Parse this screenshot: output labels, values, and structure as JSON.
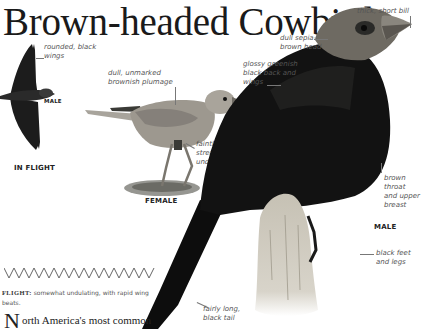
{
  "page": {
    "title": "Brown-headed Cowbird"
  },
  "figures": {
    "in_flight": {
      "sex_label": "MALE",
      "caption": "IN FLIGHT",
      "annotations": [
        {
          "id": "wings",
          "line1": "rounded, black",
          "line2": "wings"
        }
      ]
    },
    "female": {
      "caption": "FEMALE",
      "annotations": [
        {
          "id": "plumage",
          "line1": "dull, unmarked",
          "line2": "brownish plumage"
        },
        {
          "id": "underparts",
          "line1": "faintly",
          "line2": "streaked",
          "line3": "underparts"
        }
      ]
    },
    "male": {
      "caption": "MALE",
      "annotations": [
        {
          "id": "bill",
          "line1": "thick, short bill"
        },
        {
          "id": "head",
          "line1": "dull sepia-",
          "line2": "brown head"
        },
        {
          "id": "back",
          "line1": "glossy greenish",
          "line2": "black back and",
          "line3": "wings"
        },
        {
          "id": "throat",
          "line1": "brown",
          "line2": "throat",
          "line3": "and upper",
          "line4": "breast"
        },
        {
          "id": "feet",
          "line1": "black feet",
          "line2": "and legs"
        },
        {
          "id": "tail",
          "line1": "fairly long,",
          "line2": "black tail"
        }
      ]
    }
  },
  "flight_pattern": {
    "label": "FLIGHT:",
    "description": "somewhat undulating, with rapid wing beats."
  },
  "body_text": {
    "drop_cap": "N",
    "text": "orth America's most common"
  },
  "colors": {
    "male_body": "#111111",
    "male_head": "#6e6a62",
    "female_body": "#9a958c",
    "perch": "#c9c4b8",
    "annotation_text": "#555555"
  }
}
